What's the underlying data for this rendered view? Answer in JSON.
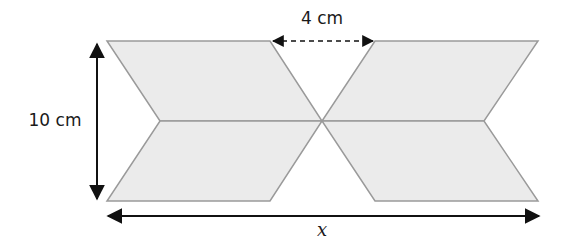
{
  "diagram": {
    "type": "geometry-figure",
    "labels": {
      "height": "10 cm",
      "gap": "4 cm",
      "width": "x"
    },
    "colors": {
      "shape_fill": "#ebebeb",
      "shape_stroke": "#9a9a9a",
      "arrow": "#111111"
    }
  }
}
